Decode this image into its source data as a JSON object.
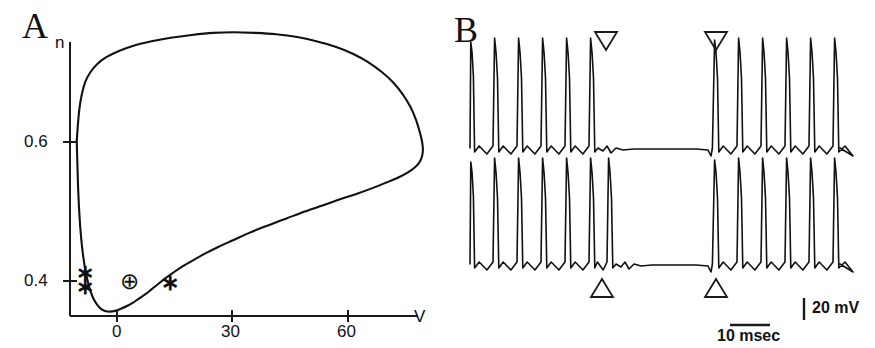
{
  "figure": {
    "panels": [
      {
        "id": "A",
        "letter": "A"
      },
      {
        "id": "B",
        "letter": "B"
      }
    ]
  },
  "panel_a": {
    "letter": "A",
    "y_axis_label": "n",
    "x_axis_label": "V",
    "y_ticks": [
      {
        "label": "0.6",
        "value": 0.6
      },
      {
        "label": "0.4",
        "value": 0.4
      }
    ],
    "x_ticks": [
      {
        "label": "0",
        "value": 0
      },
      {
        "label": "30",
        "value": 30
      },
      {
        "label": "60",
        "value": 60
      }
    ],
    "markers": [
      {
        "name": "asterisk-upper-left",
        "glyph": "∗",
        "V": -9,
        "n": 0.413
      },
      {
        "name": "asterisk-lower-left",
        "glyph": "∗",
        "V": -9,
        "n": 0.392
      },
      {
        "name": "circled-plus",
        "glyph": "⊕",
        "V": 4,
        "n": 0.398
      },
      {
        "name": "asterisk-right",
        "glyph": "∗",
        "V": 14,
        "n": 0.396
      }
    ]
  },
  "panel_b": {
    "letter": "B",
    "scale_bars": {
      "voltage_label": "20 mV",
      "time_label": "10 msec"
    },
    "markers": {
      "top_triangles": [
        {
          "name": "down-triangle-1",
          "direction": "down"
        },
        {
          "name": "down-triangle-2",
          "direction": "down"
        }
      ],
      "bottom_triangles": [
        {
          "name": "up-triangle-1",
          "direction": "up"
        },
        {
          "name": "up-triangle-2",
          "direction": "up"
        }
      ]
    },
    "traces": [
      {
        "name": "trace-top",
        "spikes_before_gap": 6,
        "spikes_after_gap": 6
      },
      {
        "name": "trace-bottom",
        "spikes_before_gap": 7,
        "spikes_after_gap": 6
      }
    ]
  },
  "chart_data": {
    "type": "line",
    "title": "",
    "panels": [
      {
        "id": "A",
        "type": "line",
        "subtype": "phase-plane-trajectory",
        "xlabel": "V",
        "ylabel": "n",
        "xlim": [
          -14,
          84
        ],
        "ylim": [
          0.345,
          0.78
        ],
        "xticks": [
          0,
          30,
          60
        ],
        "xticklabels": [
          "0",
          "30",
          "60"
        ],
        "yticks": [
          0.4,
          0.6
        ],
        "yticklabels": [
          "0.4",
          "0.6"
        ],
        "grid": false,
        "legend": null,
        "series": [
          {
            "name": "limit-cycle-trajectory",
            "closed": true,
            "points": [
              [
                -10.5,
                0.601
              ],
              [
                -10.2,
                0.625
              ],
              [
                -9.8,
                0.648
              ],
              [
                -9.2,
                0.668
              ],
              [
                -8.3,
                0.686
              ],
              [
                -7.0,
                0.7
              ],
              [
                -5.2,
                0.712
              ],
              [
                -2.8,
                0.722
              ],
              [
                0.5,
                0.731
              ],
              [
                4.5,
                0.739
              ],
              [
                9.0,
                0.745
              ],
              [
                14.0,
                0.75
              ],
              [
                19.5,
                0.754
              ],
              [
                25.0,
                0.757
              ],
              [
                30.5,
                0.758
              ],
              [
                36.0,
                0.757
              ],
              [
                41.5,
                0.755
              ],
              [
                47.0,
                0.751
              ],
              [
                52.0,
                0.745
              ],
              [
                57.0,
                0.737
              ],
              [
                61.5,
                0.727
              ],
              [
                65.5,
                0.715
              ],
              [
                69.0,
                0.701
              ],
              [
                72.0,
                0.686
              ],
              [
                74.5,
                0.669
              ],
              [
                76.5,
                0.651
              ],
              [
                78.0,
                0.632
              ],
              [
                79.0,
                0.614
              ],
              [
                79.6,
                0.6
              ],
              [
                79.8,
                0.588
              ],
              [
                79.5,
                0.578
              ],
              [
                78.8,
                0.57
              ],
              [
                77.6,
                0.563
              ],
              [
                75.8,
                0.556
              ],
              [
                73.4,
                0.549
              ],
              [
                70.4,
                0.542
              ],
              [
                66.8,
                0.534
              ],
              [
                62.8,
                0.526
              ],
              [
                58.4,
                0.518
              ],
              [
                53.8,
                0.509
              ],
              [
                49.0,
                0.5
              ],
              [
                44.2,
                0.49
              ],
              [
                39.4,
                0.48
              ],
              [
                34.8,
                0.47
              ],
              [
                30.4,
                0.459
              ],
              [
                26.4,
                0.449
              ],
              [
                22.8,
                0.439
              ],
              [
                19.6,
                0.429
              ],
              [
                16.8,
                0.42
              ],
              [
                14.4,
                0.411
              ],
              [
                12.4,
                0.403
              ],
              [
                10.6,
                0.395
              ],
              [
                9.0,
                0.388
              ],
              [
                7.4,
                0.381
              ],
              [
                5.8,
                0.375
              ],
              [
                4.2,
                0.369
              ],
              [
                2.6,
                0.364
              ],
              [
                1.0,
                0.36
              ],
              [
                -0.5,
                0.357
              ],
              [
                -1.9,
                0.356
              ],
              [
                -3.1,
                0.357
              ],
              [
                -4.2,
                0.36
              ],
              [
                -5.2,
                0.366
              ],
              [
                -6.1,
                0.374
              ],
              [
                -6.9,
                0.385
              ],
              [
                -7.6,
                0.399
              ],
              [
                -8.3,
                0.417
              ],
              [
                -8.9,
                0.439
              ],
              [
                -9.4,
                0.465
              ],
              [
                -9.8,
                0.495
              ],
              [
                -10.1,
                0.528
              ],
              [
                -10.3,
                0.562
              ],
              [
                -10.5,
                0.601
              ]
            ]
          }
        ],
        "annotations": [
          {
            "text": "∗",
            "V": -9,
            "n": 0.413
          },
          {
            "text": "∗",
            "V": -9,
            "n": 0.392
          },
          {
            "text": "⊕",
            "V": 4,
            "n": 0.398
          },
          {
            "text": "∗",
            "V": 14,
            "n": 0.396
          }
        ]
      },
      {
        "id": "B",
        "type": "line",
        "subtype": "voltage-trace",
        "xlabel": "",
        "ylabel": "",
        "grid": false,
        "legend": null,
        "scale_bars": [
          {
            "axis": "y",
            "label": "20 mV",
            "value": 20,
            "unit": "mV"
          },
          {
            "axis": "x",
            "label": "10 msec",
            "value": 10,
            "unit": "msec"
          }
        ],
        "series": [
          {
            "name": "trace-top",
            "spike_times_px": [
              472,
              496,
              520,
              544,
              568,
              592,
              716,
              740,
              764,
              788,
              812,
              836
            ],
            "gap_start_px": 596,
            "gap_end_px": 714,
            "baseline_px": 142,
            "spike_peak_px": 52,
            "trough_px": 152
          },
          {
            "name": "trace-bottom",
            "spike_times_px": [
              472,
              496,
              520,
              544,
              568,
              592,
              610,
              716,
              740,
              764,
              788,
              812,
              836
            ],
            "gap_start_px": 614,
            "gap_end_px": 714,
            "baseline_px": 258,
            "spike_peak_px": 172,
            "trough_px": 268
          }
        ],
        "annotations": [
          {
            "text": "▽",
            "x_px": 605,
            "y_px": 38,
            "name": "down-triangle-1"
          },
          {
            "text": "▽",
            "x_px": 715,
            "y_px": 38,
            "name": "down-triangle-2"
          },
          {
            "text": "△",
            "x_px": 613,
            "y_px": 285,
            "name": "up-triangle-1"
          },
          {
            "text": "△",
            "x_px": 716,
            "y_px": 285,
            "name": "up-triangle-2"
          }
        ]
      }
    ]
  }
}
